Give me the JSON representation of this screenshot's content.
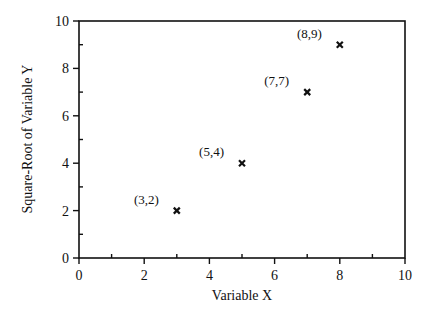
{
  "chart_data": {
    "type": "scatter",
    "title": "",
    "xlabel": "Variable X",
    "ylabel": "Square-Root of Variable Y",
    "xlim": [
      0,
      10
    ],
    "ylim": [
      0,
      10
    ],
    "xticks": [
      0,
      2,
      4,
      6,
      8,
      10
    ],
    "yticks": [
      0,
      2,
      4,
      6,
      8,
      10
    ],
    "x_tick_labels": [
      "0",
      "2",
      "4",
      "6",
      "8",
      "10"
    ],
    "y_tick_labels": [
      "0",
      "2",
      "4",
      "6",
      "8",
      "10"
    ],
    "minor_ticks": true,
    "grid": false,
    "legend": null,
    "marker": "x",
    "points": [
      {
        "x": 3,
        "y": 2,
        "label": "(3,2)"
      },
      {
        "x": 5,
        "y": 4,
        "label": "(5,4)"
      },
      {
        "x": 7,
        "y": 7,
        "label": "(7,7)"
      },
      {
        "x": 8,
        "y": 9,
        "label": "(8,9)"
      }
    ]
  }
}
